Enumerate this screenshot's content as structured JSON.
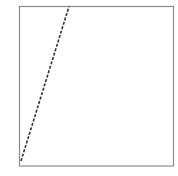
{
  "diagram": {
    "frame": {
      "x": 19.5,
      "y": 6.5,
      "width": 154,
      "height": 159.5,
      "stroke": "#8c8c8c",
      "stroke_width": 1.2
    },
    "line": {
      "x1": 21,
      "y1": 161,
      "x2": 69,
      "y2": 6.5,
      "stroke": "#333333",
      "stroke_width": 1.6,
      "dash": "3 1.6"
    }
  }
}
